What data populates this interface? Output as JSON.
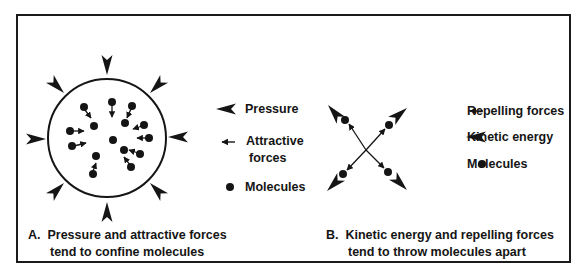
{
  "panel_a": {
    "caption_letter": "A.",
    "caption_line1": "Pressure and attractive forces",
    "caption_line2": "tend to confine molecules",
    "legend": [
      {
        "icon": "pressure-arrow-icon",
        "label": "Pressure"
      },
      {
        "icon": "attractive-force-arrow-icon",
        "label_line1": "Attractive",
        "label_line2": "forces"
      },
      {
        "icon": "molecule-dot-icon",
        "label": "Molecules"
      }
    ]
  },
  "panel_b": {
    "caption_letter": "B.",
    "caption_line1": "Kinetic energy and repelling forces",
    "caption_line2": "tend to throw molecules apart",
    "legend": [
      {
        "icon": "repelling-force-arrow-icon",
        "label": "Repelling forces"
      },
      {
        "icon": "kinetic-energy-arrow-icon",
        "label": "Kinetic energy"
      },
      {
        "icon": "molecule-dot-icon",
        "label": "Molecules"
      }
    ]
  },
  "colors": {
    "ink": "#151515",
    "background": "#ffffff"
  }
}
